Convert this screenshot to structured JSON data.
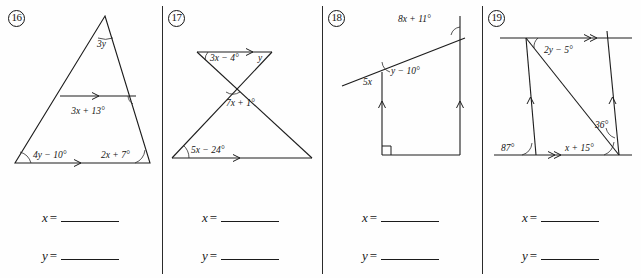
{
  "worksheet": {
    "title": "Parallel lines and angle relationships worksheet",
    "ink_color": "#141414",
    "paper_color": "#fefefe"
  },
  "problems": [
    {
      "number": "16",
      "figure": "triangle-with-midsegment",
      "labels": {
        "apex": "3y",
        "midsegment_right": "3x + 13°",
        "bottom_left": "4y − 10°",
        "bottom_right": "2x + 7°"
      },
      "answers": {
        "x_label": "x",
        "y_label": "y",
        "equals": "=",
        "x_value": "",
        "y_value": ""
      }
    },
    {
      "number": "17",
      "figure": "crossed-lines-two-transversals",
      "labels": {
        "top_left": "3x − 4°",
        "top_right": "y",
        "middle": "7x + 1°",
        "bottom_left": "5x − 24°"
      },
      "answers": {
        "x_label": "x",
        "y_label": "y",
        "equals": "=",
        "x_value": "",
        "y_value": ""
      }
    },
    {
      "number": "18",
      "figure": "two-parallel-verticals-with-transversal",
      "labels": {
        "top_right": "8x + 11°",
        "left_below": "5x",
        "interior": "y − 10°",
        "right_angle_marker": "∟"
      },
      "answers": {
        "x_label": "x",
        "y_label": "y",
        "equals": "=",
        "x_value": "",
        "y_value": ""
      }
    },
    {
      "number": "19",
      "figure": "parallelogram-with-diagonal",
      "labels": {
        "top_interior": "2y − 5°",
        "right_interior": "36°",
        "bottom_left": "87°",
        "bottom_interior": "x + 15°"
      },
      "answers": {
        "x_label": "x",
        "y_label": "y",
        "equals": "=",
        "x_value": "",
        "y_value": ""
      }
    }
  ]
}
